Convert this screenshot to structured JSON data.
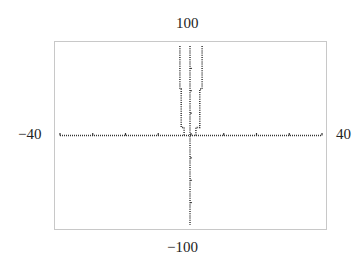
{
  "chart_data": {
    "type": "line",
    "title": "",
    "xlabel": "",
    "ylabel": "",
    "xlim": [
      -40,
      40
    ],
    "ylim": [
      -100,
      100
    ],
    "grid": false,
    "legend": null,
    "tick_labels": {
      "x_min": "−40",
      "x_max": "40",
      "y_max": "100",
      "y_min": "−100"
    },
    "x_ticks": [
      -40,
      -30,
      -20,
      -10,
      0,
      10,
      20,
      30,
      40
    ],
    "series": [
      {
        "name": "left-branch",
        "style": "dotted",
        "points": [
          [
            -3.4,
            100
          ],
          [
            -3.4,
            52
          ],
          [
            -3.0,
            52
          ],
          [
            -3.0,
            9
          ],
          [
            -2.1,
            9
          ],
          [
            -2.1,
            0
          ]
        ]
      },
      {
        "name": "center-line",
        "style": "dotted",
        "points": [
          [
            -0.3,
            100
          ],
          [
            -0.3,
            -100
          ]
        ]
      },
      {
        "name": "right-branch",
        "style": "dotted",
        "points": [
          [
            3.4,
            100
          ],
          [
            3.4,
            52
          ],
          [
            2.7,
            52
          ],
          [
            2.7,
            9
          ],
          [
            1.5,
            9
          ],
          [
            1.5,
            0
          ]
        ]
      }
    ]
  }
}
